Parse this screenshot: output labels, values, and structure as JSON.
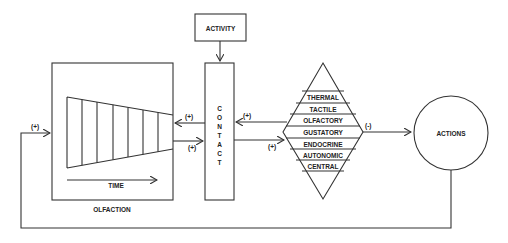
{
  "diagram": {
    "nodes": {
      "activity": "ACTIVITY",
      "contact": [
        "C",
        "O",
        "N",
        "T",
        "A",
        "C",
        "T"
      ],
      "olfaction": "OLFACTION",
      "time": "TIME",
      "actions": "ACTIONS"
    },
    "senses": [
      "THERMAL",
      "TACTILE",
      "OLFACTORY",
      "GUSTATORY",
      "ENDOCRINE",
      "AUTONOMIC",
      "CENTRAL"
    ],
    "signs": {
      "feedback_to_olfaction": "(+)",
      "contact_to_olfaction": "(+)",
      "olfaction_to_contact": "(+)",
      "senses_to_contact": "(+)",
      "contact_to_senses": "(+)",
      "senses_to_actions": "(-)"
    }
  }
}
